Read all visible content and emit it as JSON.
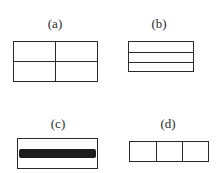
{
  "figures": [
    {
      "id": "a",
      "label": "(a)",
      "description": "Rectangle divided into four quadrants by one horizontal and one vertical line"
    },
    {
      "id": "b",
      "label": "(b)",
      "description": "Rectangle divided into three horizontal strips by two horizontal lines"
    },
    {
      "id": "c",
      "label": "(c)",
      "description": "Rectangle with a thick dark horizontal band across its middle"
    },
    {
      "id": "d",
      "label": "(d)",
      "description": "Rectangle divided into three vertical sections by two vertical lines"
    }
  ],
  "colors": {
    "line": "#2a2a2a",
    "band": "#1c1c1c",
    "background": "#ffffff"
  }
}
